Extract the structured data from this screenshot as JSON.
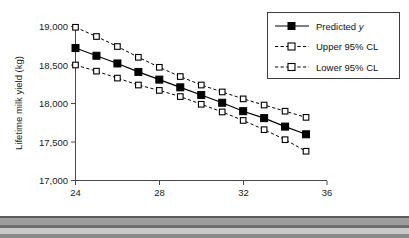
{
  "chart_data": {
    "type": "line",
    "title": "",
    "xlabel": "Age at first calving (months)",
    "ylabel": "Lifetime milk yield (kg)",
    "xlim": [
      24,
      36
    ],
    "ylim": [
      17000,
      19000
    ],
    "grid": false,
    "legend_position": "top-right",
    "x": [
      24,
      25,
      26,
      27,
      28,
      29,
      30,
      31,
      32,
      33,
      34,
      35
    ],
    "xticks": [
      "24",
      "28",
      "32",
      "36"
    ],
    "xtick_values": [
      24,
      28,
      32,
      36
    ],
    "yticks": [
      "19,000",
      "18,500",
      "18,000",
      "17,500",
      "17,000"
    ],
    "ytick_values": [
      19000,
      18500,
      18000,
      17500,
      17000
    ],
    "series": [
      {
        "name": "Predicted y",
        "style": "solid",
        "marker": "filled-square",
        "values": [
          18720,
          18620,
          18520,
          18410,
          18310,
          18210,
          18110,
          18010,
          17900,
          17810,
          17700,
          17600
        ]
      },
      {
        "name": "Upper 95% CL",
        "style": "dashed",
        "marker": "open-square",
        "values": [
          18990,
          18870,
          18740,
          18600,
          18470,
          18350,
          18240,
          18150,
          18060,
          17980,
          17900,
          17820
        ]
      },
      {
        "name": "Lower 95% CL",
        "style": "dashed",
        "marker": "open-square",
        "values": [
          18500,
          18420,
          18330,
          18240,
          18170,
          18090,
          17990,
          17890,
          17780,
          17660,
          17530,
          17380
        ]
      }
    ]
  },
  "legend": {
    "entries": [
      {
        "label": "Predicted ",
        "italic_suffix": "y"
      },
      {
        "label": "Upper 95% CL",
        "italic_suffix": ""
      },
      {
        "label": "Lower 95% CL",
        "italic_suffix": ""
      }
    ]
  },
  "axis": {
    "x_title": "Age at first calving (months)",
    "y_title": "Lifetime milk yield (kg)"
  }
}
